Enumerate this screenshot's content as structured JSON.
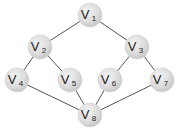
{
  "diagram": {
    "type": "graph",
    "node_radius": 12,
    "colors": {
      "node_fill": "#dcdcdc",
      "node_highlight": "#f2f2f2",
      "edge": "#555555",
      "text": "#222222"
    },
    "nodes": [
      {
        "id": "v1",
        "letter": "V",
        "sub": "1",
        "x": 90,
        "y": 15
      },
      {
        "id": "v2",
        "letter": "V",
        "sub": "2",
        "x": 40,
        "y": 47
      },
      {
        "id": "v3",
        "letter": "V",
        "sub": "3",
        "x": 137,
        "y": 47
      },
      {
        "id": "v4",
        "letter": "V",
        "sub": "4",
        "x": 17,
        "y": 80
      },
      {
        "id": "v5",
        "letter": "V",
        "sub": "5",
        "x": 70,
        "y": 80
      },
      {
        "id": "v6",
        "letter": "V",
        "sub": "6",
        "x": 110,
        "y": 80
      },
      {
        "id": "v7",
        "letter": "V",
        "sub": "7",
        "x": 162,
        "y": 80
      },
      {
        "id": "v8",
        "letter": "V",
        "sub": "8",
        "x": 90,
        "y": 115
      }
    ],
    "edges": [
      [
        "v1",
        "v2"
      ],
      [
        "v1",
        "v3"
      ],
      [
        "v2",
        "v4"
      ],
      [
        "v2",
        "v5"
      ],
      [
        "v3",
        "v6"
      ],
      [
        "v3",
        "v7"
      ],
      [
        "v4",
        "v8"
      ],
      [
        "v5",
        "v8"
      ],
      [
        "v6",
        "v8"
      ],
      [
        "v7",
        "v8"
      ]
    ]
  }
}
